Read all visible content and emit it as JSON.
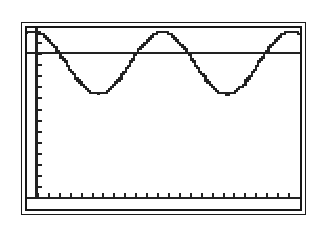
{
  "screen": {
    "device_label": "graphing-calculator-screen",
    "frame_color": "#1a1a1a",
    "background_color": "#ffffff",
    "trace_color": "#222222"
  },
  "chart_data": {
    "type": "line",
    "title": "",
    "subtitle": "",
    "xlabel": "",
    "ylabel": "",
    "grid": false,
    "legend": false,
    "axes": {
      "x_axis_visible": true,
      "y_axis_visible": true,
      "x_axis_position_y": 0.06,
      "y_axis_position_x": 0.035,
      "x_tick_count": 24,
      "y_tick_count": 14,
      "x_tick_spacing": 0.0417,
      "y_tick_spacing": 0.0695,
      "xlim": [
        0,
        24
      ],
      "ylim": [
        -1.6,
        1.6
      ],
      "tick_length_px": 5
    },
    "series": [
      {
        "name": "sinusoid",
        "style": "pixelated-stepped",
        "description": "cosine-like wave, two full periods, starting at a maximum",
        "amplitude": 0.55,
        "period": 11.3,
        "vertical_offset": 0.98,
        "phase": "starts at maximum",
        "peaks": [
          {
            "x": 0.6,
            "y": 1.52
          },
          {
            "x": 12.0,
            "y": 1.52
          },
          {
            "x": 23.4,
            "y": 1.52
          }
        ],
        "troughs": [
          {
            "x": 6.3,
            "y": 0.42
          },
          {
            "x": 17.7,
            "y": 0.42
          }
        ],
        "x": [
          0.0,
          0.6,
          1.5,
          2.5,
          3.5,
          4.5,
          5.4,
          6.3,
          7.2,
          8.1,
          9.1,
          10.1,
          11.1,
          12.0,
          12.9,
          13.9,
          14.9,
          15.9,
          16.8,
          17.7,
          18.6,
          19.5,
          20.5,
          21.5,
          22.5,
          23.4,
          24.0
        ],
        "y": [
          1.47,
          1.52,
          1.44,
          1.25,
          1.0,
          0.72,
          0.52,
          0.42,
          0.48,
          0.65,
          0.92,
          1.2,
          1.42,
          1.52,
          1.45,
          1.27,
          1.01,
          0.73,
          0.52,
          0.42,
          0.47,
          0.64,
          0.9,
          1.19,
          1.41,
          1.52,
          1.5
        ]
      },
      {
        "name": "horizontal-line",
        "style": "solid",
        "description": "constant horizontal line intersecting the sinusoid",
        "value": 1.16,
        "x": [
          0,
          24
        ],
        "y": [
          1.16,
          1.16
        ],
        "intersection_count": 4
      }
    ],
    "intersections": [
      {
        "x": 2.1,
        "y": 1.16
      },
      {
        "x": 10.5,
        "y": 1.16
      },
      {
        "x": 13.5,
        "y": 1.16
      },
      {
        "x": 21.9,
        "y": 1.16
      }
    ]
  }
}
